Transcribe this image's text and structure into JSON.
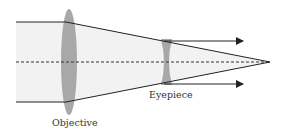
{
  "diagram": {
    "labels": {
      "objective": "Objective",
      "eyepiece": "Eyepiece"
    },
    "colors": {
      "beam_fill": "#f0f0f0",
      "lens_fill": "#a9a9a9",
      "ray": "#222222",
      "axis": "#333333"
    },
    "elements": [
      {
        "type": "converging-lens",
        "name": "Objective"
      },
      {
        "type": "diverging-lens",
        "name": "Eyepiece"
      },
      {
        "type": "optical-axis",
        "style": "dashed"
      },
      {
        "type": "incoming-parallel-rays",
        "count": 2
      },
      {
        "type": "outgoing-parallel-rays",
        "count": 2,
        "arrows": true
      },
      {
        "type": "focal-point"
      }
    ]
  }
}
